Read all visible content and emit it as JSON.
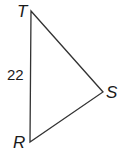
{
  "diagram": {
    "type": "triangle",
    "vertices": {
      "T": {
        "label": "T",
        "x": 31,
        "y": 11
      },
      "S": {
        "label": "S",
        "x": 103,
        "y": 92
      },
      "R": {
        "label": "R",
        "x": 30,
        "y": 142
      }
    },
    "sides": [
      {
        "from": "T",
        "to": "R",
        "length_label": "22"
      },
      {
        "from": "T",
        "to": "S",
        "length_label": ""
      },
      {
        "from": "S",
        "to": "R",
        "length_label": ""
      }
    ],
    "stroke_color": "#333333",
    "label_color": "#1a1a1a"
  }
}
